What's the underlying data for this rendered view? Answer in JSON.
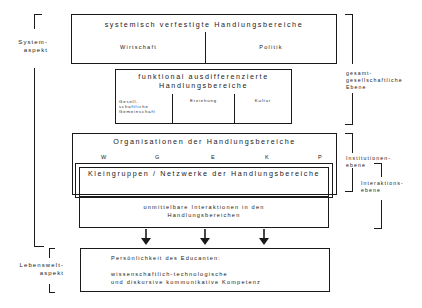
{
  "left_labels": {
    "system_aspect": [
      "System-",
      "aspekt"
    ],
    "lifeworld_aspect": [
      "Lebenswelt-",
      "aspekt"
    ]
  },
  "right_labels": {
    "societal_level": [
      "gesamt-",
      "gesellschaftliche",
      "Ebene"
    ],
    "institutional_level": [
      "Institutionen-",
      "ebene"
    ],
    "interaction_level": [
      "Interaktions-",
      "ebene"
    ]
  },
  "boxes": {
    "systemic": {
      "title": "systemisch verfestigte Handlungsbereiche",
      "cells": [
        "Wirtschaft",
        "Politik"
      ]
    },
    "functional": {
      "title_lines": [
        "funktional ausdifferenzierte",
        "Handlungsbereiche"
      ],
      "cells": [
        "Gesell-\nschaftliche\nGemeinschaft",
        "Erziehung",
        "Kultur"
      ],
      "cell0_lines": [
        "Gesell-",
        "schaftliche",
        "Gemeinschaft"
      ]
    },
    "organisations": {
      "title": "Organisationen der Handlungsbereiche",
      "letters": [
        "W",
        "G",
        "E",
        "K",
        "P"
      ]
    },
    "small_groups": {
      "title": "Kleingruppen / Netzwerke der Handlungsbereiche"
    },
    "interactions": {
      "title_lines": [
        "unmittelbare Interaktionen in den",
        "Handlungsbereichen"
      ]
    },
    "personality": {
      "title": "Persönlichkeit des Educanten:",
      "competence_lines": [
        "wissenschaftlich-technologische",
        "und diskursive kommunikative Kompetenz"
      ]
    }
  },
  "arrows": {
    "count": 3,
    "icon": "arrow-down-icon"
  }
}
